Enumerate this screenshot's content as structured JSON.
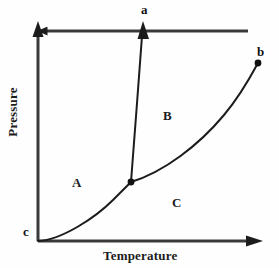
{
  "diagram": {
    "type": "phase-diagram",
    "title": "",
    "background_color": "#fefefe",
    "line_color": "#1c1c1c",
    "axes": {
      "x": {
        "label": "Temperature",
        "origin_px": [
          38,
          241
        ],
        "end_px": [
          262,
          241
        ],
        "arrow": true,
        "ticks": []
      },
      "y": {
        "label": "Pressure",
        "origin_px": [
          38,
          241
        ],
        "end_px": [
          38,
          22
        ],
        "arrow": true,
        "ticks": []
      }
    },
    "regions": [
      {
        "id": "A",
        "label": "A",
        "position_px": [
          77,
          183
        ],
        "meaning": ""
      },
      {
        "id": "B",
        "label": "B",
        "position_px": [
          168,
          116
        ],
        "meaning": ""
      },
      {
        "id": "C",
        "label": "C",
        "position_px": [
          177,
          203
        ],
        "meaning": ""
      }
    ],
    "points": [
      {
        "id": "a",
        "label": "a",
        "position_px": [
          145,
          10
        ],
        "kind": "curve-end-arrow",
        "dot": false
      },
      {
        "id": "b",
        "label": "b",
        "position_px": [
          261,
          52
        ],
        "kind": "critical-point",
        "dot": true,
        "dot_px": [
          258,
          63
        ]
      },
      {
        "id": "c",
        "label": "c",
        "position_px": [
          27,
          231
        ],
        "kind": "axis-origin-marker",
        "dot": false
      },
      {
        "id": "triple",
        "label": "",
        "position_px": [
          131,
          182
        ],
        "kind": "triple-point",
        "dot": true,
        "dot_px": [
          131,
          182
        ]
      }
    ],
    "curves": [
      {
        "id": "sublimation-curve",
        "name": "sublimation-curve",
        "from": [
          38,
          241
        ],
        "to": [
          131,
          182
        ],
        "arrow_end": false,
        "end_dot": false,
        "path": "M 38 241 C 62 240, 96 217, 113 200 C 121 192, 127 186, 131 182"
      },
      {
        "id": "fusion-curve",
        "name": "fusion-curve",
        "from": [
          131,
          182
        ],
        "to": [
          143,
          29
        ],
        "arrow_end": true,
        "end_dot": false,
        "path": "M 131 182 C 134 140, 139 80, 142 31"
      },
      {
        "id": "vaporization-curve",
        "name": "vaporization-curve",
        "from": [
          131,
          182
        ],
        "to": [
          258,
          63
        ],
        "arrow_end": false,
        "end_dot": true,
        "path": "M 131 182 C 164 172, 199 145, 224 115 C 240 96, 251 76, 258 63"
      }
    ]
  }
}
